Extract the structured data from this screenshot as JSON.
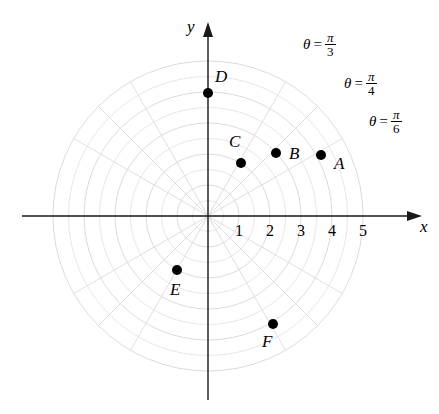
{
  "figure": {
    "background_color": "#ffffff",
    "axis_color": "#1a1a1a",
    "grid_color": "#d8d4dc",
    "point_color": "#000000"
  },
  "axes": {
    "x_label": "x",
    "y_label": "y",
    "origin_px": {
      "x": 208,
      "y": 216
    },
    "pixels_per_unit": 31,
    "x_tick_labels": [
      "1",
      "2",
      "3",
      "4",
      "5"
    ],
    "x_tick_values": [
      1,
      2,
      3,
      4,
      5
    ],
    "y_tick_labels": [],
    "x_range_px": [
      22,
      422
    ],
    "y_range_px": [
      22,
      400
    ]
  },
  "polar_grid": {
    "circle_radii": [
      0.5,
      1,
      1.5,
      2,
      2.5,
      3,
      3.5,
      4,
      4.5,
      5
    ],
    "ray_angles_deg": [
      0,
      30,
      45,
      60,
      90,
      120,
      135,
      150,
      180,
      210,
      225,
      240,
      270,
      300,
      315,
      330
    ],
    "max_radius": 5
  },
  "points": [
    {
      "name": "A",
      "label": "A",
      "cx": 321,
      "cy": 155,
      "r_units": 3.7,
      "label_x": 334,
      "label_y": 155
    },
    {
      "name": "B",
      "label": "B",
      "cx": 276,
      "cy": 153,
      "r_units": 2.5,
      "label_x": 289,
      "label_y": 145
    },
    {
      "name": "C",
      "label": "C",
      "cx": 241,
      "cy": 163,
      "r_units": 2.0,
      "label_x": 229,
      "label_y": 133
    },
    {
      "name": "D",
      "label": "D",
      "cx": 208,
      "cy": 93,
      "r_units": 4.0,
      "label_x": 215,
      "label_y": 68
    },
    {
      "name": "E",
      "label": "E",
      "cx": 177,
      "cy": 270,
      "r_units": 2.0,
      "label_x": 170,
      "label_y": 281
    },
    {
      "name": "F",
      "label": "F",
      "cx": 273,
      "cy": 324,
      "r_units": 3.6,
      "label_x": 262,
      "label_y": 333
    }
  ],
  "theta_annotations": [
    {
      "name": "theta-pi-3",
      "theta": "θ",
      "equals": "=",
      "numerator": "π",
      "denominator": "3",
      "x": 303,
      "y": 31
    },
    {
      "name": "theta-pi-4",
      "theta": "θ",
      "equals": "=",
      "numerator": "π",
      "denominator": "4",
      "x": 344,
      "y": 70
    },
    {
      "name": "theta-pi-6",
      "theta": "θ",
      "equals": "=",
      "numerator": "π",
      "denominator": "6",
      "x": 369,
      "y": 108
    }
  ]
}
